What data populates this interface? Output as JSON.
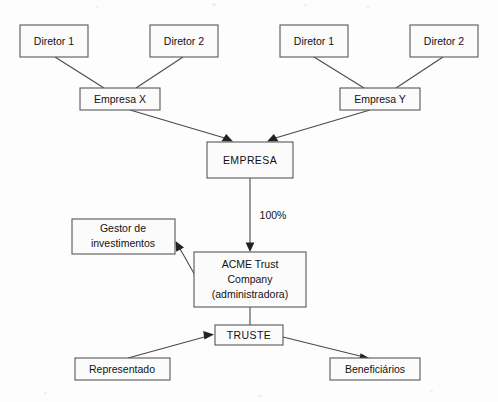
{
  "diagram": {
    "type": "organizational-structure",
    "language": "pt-BR",
    "colors": {
      "page_background": "#fdfdfd",
      "box_fill": "#fbfbfb",
      "box_border": "#58585a",
      "line": "#4a4a4c",
      "arrow_head": "#232325",
      "text": "#121214"
    },
    "nodes": {
      "diretor_x1": {
        "label": "Diretor 1"
      },
      "diretor_x2": {
        "label": "Diretor 2"
      },
      "diretor_y1": {
        "label": "Diretor 1"
      },
      "diretor_y2": {
        "label": "Diretor 2"
      },
      "empresa_x": {
        "label": "Empresa X"
      },
      "empresa_y": {
        "label": "Empresa Y"
      },
      "empresa": {
        "label": "EMPRESA"
      },
      "gestor": {
        "line1": "Gestor de",
        "line2": "investimentos"
      },
      "acme": {
        "line1": "ACME Trust",
        "line2": "Company",
        "line3": "(administradora)"
      },
      "truste": {
        "label": "TRUSTE"
      },
      "representado": {
        "label": "Representado"
      },
      "beneficiarios": {
        "label": "Beneficiários"
      }
    },
    "edges": [
      {
        "id": "edge-diretor-x1-empresa-x",
        "from": "diretor_x1",
        "to": "empresa_x",
        "label": "",
        "arrow": false
      },
      {
        "id": "edge-diretor-x2-empresa-x",
        "from": "diretor_x2",
        "to": "empresa_x",
        "label": "",
        "arrow": false
      },
      {
        "id": "edge-diretor-y1-empresa-y",
        "from": "diretor_y1",
        "to": "empresa_y",
        "label": "",
        "arrow": false
      },
      {
        "id": "edge-diretor-y2-empresa-y",
        "from": "diretor_y2",
        "to": "empresa_y",
        "label": "",
        "arrow": false
      },
      {
        "id": "edge-empresa-x-empresa",
        "from": "empresa_x",
        "to": "empresa",
        "label": "",
        "arrow": true
      },
      {
        "id": "edge-empresa-y-empresa",
        "from": "empresa_y",
        "to": "empresa",
        "label": "",
        "arrow": true
      },
      {
        "id": "edge-empresa-acme",
        "from": "empresa",
        "to": "acme",
        "label": "100%",
        "arrow": true
      },
      {
        "id": "edge-acme-gestor",
        "from": "acme",
        "to": "gestor",
        "label": "",
        "arrow": true
      },
      {
        "id": "edge-acme-truste",
        "from": "acme",
        "to": "truste",
        "label": "",
        "arrow": false
      },
      {
        "id": "edge-representado-truste",
        "from": "representado",
        "to": "truste",
        "label": "",
        "arrow": true
      },
      {
        "id": "edge-truste-beneficiarios",
        "from": "truste",
        "to": "beneficiarios",
        "label": "",
        "arrow": true
      }
    ],
    "labels": {
      "ownership_percent": "100%"
    }
  }
}
